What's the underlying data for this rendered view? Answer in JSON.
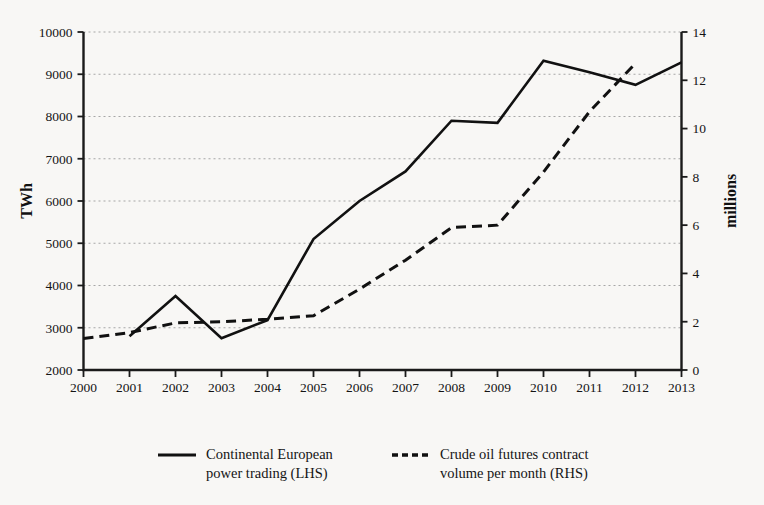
{
  "chart_data": {
    "type": "line",
    "title": "",
    "xlabel": "",
    "ylabel": "TWh",
    "y2label": "millions",
    "grid": true,
    "legend_position": "bottom",
    "x": [
      2000,
      2001,
      2002,
      2003,
      2004,
      2005,
      2006,
      2007,
      2008,
      2009,
      2010,
      2011,
      2012,
      2013
    ],
    "xtick_labels": [
      "2000",
      "2001",
      "2002",
      "2003",
      "2004",
      "2005",
      "2006",
      "2007",
      "2008",
      "2009",
      "2010",
      "2011",
      "2012",
      "2013"
    ],
    "ylim": [
      2000,
      10000
    ],
    "ytick_labels": [
      "2000",
      "3000",
      "4000",
      "5000",
      "6000",
      "7000",
      "8000",
      "9000",
      "10000"
    ],
    "yticks": [
      2000,
      3000,
      4000,
      5000,
      6000,
      7000,
      8000,
      9000,
      10000
    ],
    "y2lim": [
      0,
      14
    ],
    "y2tick_labels": [
      "0",
      "2",
      "4",
      "6",
      "8",
      "10",
      "12",
      "14"
    ],
    "y2ticks": [
      0,
      2,
      4,
      6,
      8,
      10,
      12,
      14
    ],
    "series": [
      {
        "name": "Continental European power trading (LHS)",
        "axis": "left",
        "style": "solid",
        "x": [
          2001,
          2002,
          2003,
          2004,
          2005,
          2006,
          2007,
          2008,
          2009,
          2010,
          2011,
          2012,
          2013
        ],
        "values": [
          2800,
          3750,
          2750,
          3180,
          5100,
          6000,
          6700,
          7900,
          7850,
          9320,
          9050,
          8750,
          9280
        ]
      },
      {
        "name": "Crude oil futures contract volume per month (RHS)",
        "axis": "right",
        "style": "dashed",
        "x": [
          2000,
          2001,
          2002,
          2003,
          2004,
          2005,
          2006,
          2007,
          2008,
          2009,
          2010,
          2011,
          2012
        ],
        "values": [
          1.3,
          1.55,
          1.95,
          2.0,
          2.1,
          2.25,
          3.35,
          4.55,
          5.9,
          6.0,
          8.2,
          10.7,
          12.7
        ]
      }
    ]
  },
  "legend": {
    "entries": [
      {
        "line1": "Continental European",
        "line2": "power trading (LHS)",
        "style": "solid"
      },
      {
        "line1": "Crude oil futures contract",
        "line2": "volume per month (RHS)",
        "style": "dashed"
      }
    ]
  },
  "colors": {
    "line": "#111111",
    "grid": "#9a9a9a",
    "axis": "#1a1a1a",
    "background": "#f8f7f5"
  }
}
